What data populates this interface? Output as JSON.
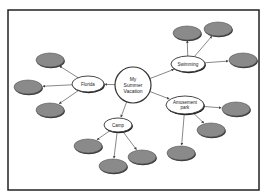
{
  "diagram": {
    "type": "mind-map",
    "frame": {
      "x": 8,
      "y": 10,
      "width": 251,
      "height": 180,
      "stroke": "#222222"
    },
    "colors": {
      "background": "#ffffff",
      "main_fill": "#ffffff",
      "main_stroke": "#333333",
      "leaf_fill": "#8a8a8a",
      "leaf_stroke": "#555555",
      "leaf_shadow": "#3a3a3a",
      "edge": "#555555",
      "text": "#222222"
    },
    "center": {
      "id": "center",
      "label_lines": [
        "My",
        "Summer",
        "Vacation"
      ],
      "cx": 133,
      "cy": 85,
      "r": 18
    },
    "branches": [
      {
        "id": "florida",
        "label_lines": [
          "Florida"
        ],
        "cx": 88,
        "cy": 84,
        "rx": 16,
        "ry": 8,
        "leaves": [
          {
            "label": "",
            "cx": 50,
            "cy": 60
          },
          {
            "label": "",
            "cx": 28,
            "cy": 87
          },
          {
            "label": "",
            "cx": 50,
            "cy": 110
          }
        ]
      },
      {
        "id": "swimming",
        "label_lines": [
          "Swimming"
        ],
        "cx": 188,
        "cy": 64,
        "rx": 17,
        "ry": 8,
        "leaves": [
          {
            "label": "",
            "cx": 187,
            "cy": 33
          },
          {
            "label": "",
            "cx": 218,
            "cy": 29
          },
          {
            "label": "",
            "cx": 243,
            "cy": 60
          }
        ]
      },
      {
        "id": "amusement-park",
        "label_lines": [
          "Amusement",
          "park"
        ],
        "cx": 185,
        "cy": 105,
        "rx": 19,
        "ry": 9,
        "leaves": [
          {
            "label": "",
            "cx": 236,
            "cy": 109
          },
          {
            "label": "",
            "cx": 211,
            "cy": 130
          },
          {
            "label": "",
            "cx": 181,
            "cy": 153
          }
        ]
      },
      {
        "id": "camp",
        "label_lines": [
          "Camp"
        ],
        "cx": 118,
        "cy": 125,
        "rx": 14,
        "ry": 7,
        "leaves": [
          {
            "label": "",
            "cx": 88,
            "cy": 146
          },
          {
            "label": "",
            "cx": 113,
            "cy": 166
          },
          {
            "label": "",
            "cx": 142,
            "cy": 157
          }
        ]
      }
    ],
    "leaf_size": {
      "rx": 14,
      "ry": 7
    }
  }
}
